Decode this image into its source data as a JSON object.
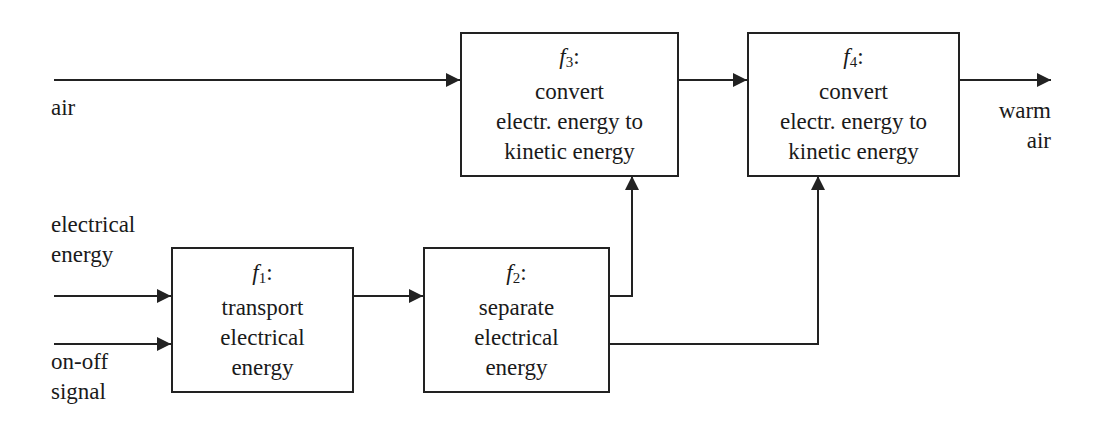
{
  "diagram": {
    "type": "function-structure block diagram",
    "boxes": [
      {
        "id": "f1",
        "symbol": "f",
        "index": "1",
        "colon": ":",
        "lines": [
          "transport",
          "electrical",
          "energy"
        ]
      },
      {
        "id": "f2",
        "symbol": "f",
        "index": "2",
        "colon": ":",
        "lines": [
          "separate",
          "electrical",
          "energy"
        ]
      },
      {
        "id": "f3",
        "symbol": "f",
        "index": "3",
        "colon": ":",
        "lines": [
          "convert",
          "electr. energy to",
          "kinetic energy"
        ]
      },
      {
        "id": "f4",
        "symbol": "f",
        "index": "4",
        "colon": ":",
        "lines": [
          "convert",
          "electr. energy to",
          "kinetic energy"
        ]
      }
    ],
    "inputs": {
      "air": "air",
      "electrical_energy": [
        "electrical",
        "energy"
      ],
      "on_off_signal": [
        "on-off",
        "signal"
      ]
    },
    "outputs": {
      "warm_air": [
        "warm",
        "air"
      ]
    },
    "edges": [
      {
        "from": "input:air",
        "to": "f3"
      },
      {
        "from": "input:electrical energy",
        "to": "f1"
      },
      {
        "from": "input:on-off signal",
        "to": "f1"
      },
      {
        "from": "f1",
        "to": "f2"
      },
      {
        "from": "f2",
        "to": "f3"
      },
      {
        "from": "f2",
        "to": "f4"
      },
      {
        "from": "f3",
        "to": "f4"
      },
      {
        "from": "f4",
        "to": "output:warm air"
      }
    ],
    "colors": {
      "line": "#222222",
      "background": "#ffffff",
      "text": "#1a1a1a"
    }
  }
}
